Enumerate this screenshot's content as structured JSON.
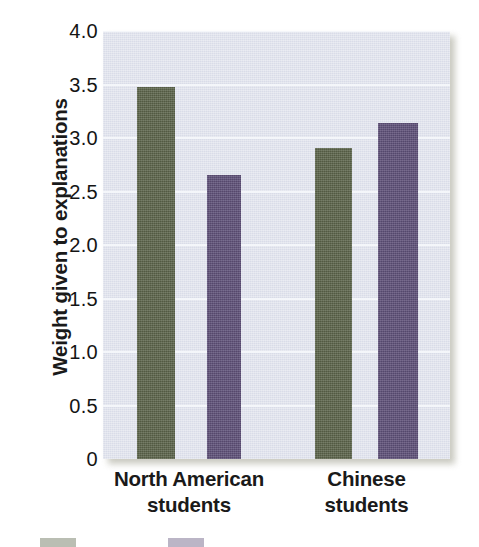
{
  "chart_data": {
    "type": "bar",
    "title": "",
    "subtitle": "",
    "xlabel": "",
    "ylabel": "Weight given to explanations",
    "categories": [
      "North American students",
      "Chinese students"
    ],
    "category_lines": [
      [
        "North American",
        "students"
      ],
      [
        "Chinese",
        "students"
      ]
    ],
    "series": [
      {
        "name": "series-1",
        "color": "#5a6349",
        "values": [
          3.48,
          2.91
        ]
      },
      {
        "name": "series-2",
        "color": "#5d4f77",
        "values": [
          2.65,
          3.14
        ]
      }
    ],
    "ylim": [
      0,
      4.0
    ],
    "ytick_values": [
      0,
      0.5,
      1.0,
      1.5,
      2.0,
      2.5,
      3.0,
      3.5,
      4.0
    ],
    "ytick_labels": [
      "0",
      "0.5",
      "1.0",
      "1.5",
      "2.0",
      "2.5",
      "3.0",
      "3.5",
      "4.0"
    ],
    "grid": true,
    "gridline_color": "#f4f6fa",
    "plot_background": "#d9dce8",
    "legend_position": "bottom",
    "legend_entries": [
      {
        "label": "",
        "color": "#5a6349"
      },
      {
        "label": "",
        "color": "#5d4f77"
      }
    ],
    "bar_layout": {
      "groups": [
        {
          "category_index": 0,
          "bars": [
            {
              "series_index": 0,
              "x_left": 34,
              "width": 38,
              "value": 3.48
            },
            {
              "series_index": 1,
              "x_left": 104,
              "width": 34,
              "value": 2.65
            }
          ]
        },
        {
          "category_index": 1,
          "bars": [
            {
              "series_index": 0,
              "x_left": 212,
              "width": 37,
              "value": 2.91
            },
            {
              "series_index": 1,
              "x_left": 275,
              "width": 40,
              "value": 3.14
            }
          ]
        }
      ]
    },
    "axis_geometry": {
      "plot_left": 103,
      "plot_top": 31,
      "plot_width": 347,
      "plot_height": 428,
      "baseline_y": 459,
      "pixels_per_unit": 107
    }
  }
}
